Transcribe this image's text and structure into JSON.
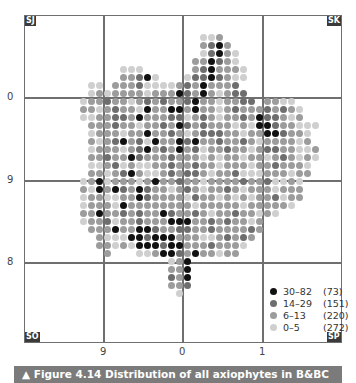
{
  "figure": {
    "caption": "▲ Figure 4.14 Distribution of all axiophytes in B&BC",
    "corners": {
      "top_left": "SJ",
      "top_right": "SK",
      "bottom_left": "SO",
      "bottom_right": "SP"
    },
    "y_ticks": [
      {
        "label": "0",
        "y": 97
      },
      {
        "label": "9",
        "y": 180
      },
      {
        "label": "8",
        "y": 262
      }
    ],
    "x_ticks": [
      {
        "label": "9",
        "x": 103
      },
      {
        "label": "0",
        "x": 182
      },
      {
        "label": "1",
        "x": 262
      }
    ]
  },
  "legend": {
    "items": [
      {
        "range": "30–82",
        "count": "(73)",
        "color": "#111111"
      },
      {
        "range": "14–29",
        "count": "(151)",
        "color": "#6e6e6e"
      },
      {
        "range": "6–13",
        "count": "(220)",
        "color": "#9c9c9c"
      },
      {
        "range": "0–5",
        "count": "(272)",
        "color": "#cfcfcf"
      }
    ]
  },
  "colors": {
    "class0": "#111111",
    "class1": "#6e6e6e",
    "class2": "#9c9c9c",
    "class3": "#cfcfcf"
  },
  "chart_data": {
    "type": "heatmap",
    "title": "Figure 4.14 Distribution of all axiophytes in B&BC",
    "grid_squares": {
      "top_left": "SJ",
      "top_right": "SK",
      "bottom_left": "SO",
      "bottom_right": "SP"
    },
    "x_tick_labels": [
      "9",
      "0",
      "1"
    ],
    "y_tick_labels": [
      "0",
      "9",
      "8"
    ],
    "legend": [
      {
        "class": "30–82",
        "count": 73
      },
      {
        "class": "14–29",
        "count": 151
      },
      {
        "class": "6–13",
        "count": 220
      },
      {
        "class": "0–5",
        "count": 272
      }
    ],
    "dot_grid": {
      "origin_x": 43,
      "origin_y": 37,
      "step": 8,
      "legend_classes": "0=30–82, 1=14–29, 2=6–13, 3=0–5, .=no data",
      "rows": [
        "....................332..............",
        "....................2102.............",
        "....................31023............",
        "...................220123...........",
        "..........333......2102223..........",
        "..........22103...31101233..........",
        "......33.2221333321202221...........",
        "......32322223222012023211..........",
        ".....3221223212122102232211.2233....",
        ".....2232122302200202232122212123...",
        ".....3322112022211321232212011232...",
        "......22212232212012122232300122333.",
        "......3222322022123211122322001223..",
        "......2321021302201022122123222232..",
        "......32223210212021322122321122332.",
        "......22122012221222323223223212323.",
        "......3321323322122122322232212223..",
        "......2232102332121123221333222322..",
        ".....3203222320221223222212213323...",
        ".....2302012012232123221232223222...",
        ".....3223322012222312232323221322...",
        ".....322230222222223222223222223....",
        ".....2202212122012212322122323.......",
        ".....32213221222000221212232........",
        "......2220220012211221222212........",
        ".......23330010002223321212.........",
        ".......2232300010022212223..........",
        "........2...3320012022322...........",
        "................320.................",
        "................220.................",
        "................120.................",
        "................221.................",
        ".................3.................."
      ]
    }
  }
}
